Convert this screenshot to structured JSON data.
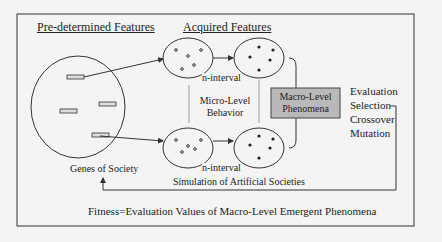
{
  "diagram": {
    "headings": {
      "predetermined": "Pre-determined Features",
      "acquired": "Acquired Features"
    },
    "genes_label": "Genes of Society",
    "interval_top": "n-interval",
    "interval_bottom": "n-interval",
    "micro_level": {
      "line1": "Micro-Level",
      "line2": "Behavior"
    },
    "macro_box": {
      "line1": "Macro-Level",
      "line2": "Phenomena",
      "fill": "#b9b9b9"
    },
    "simulation_label": "Simulation of Artificial Societies",
    "ga_steps": [
      "Evaluation",
      "Selection",
      "Crossover",
      "Mutation"
    ],
    "fitness_label": "Fitness=Evaluation Values of Macro-Level Emergent  Phenomena",
    "colors": {
      "background": "#f4f4f4",
      "stroke": "#333333"
    }
  }
}
